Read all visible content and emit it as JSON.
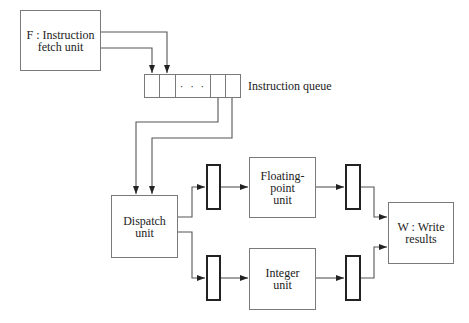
{
  "diagram": {
    "nodes": {
      "fetch": {
        "label": "F : Instruction\nfetch unit"
      },
      "queue": {
        "label": "Instruction queue",
        "ellipsis": "· · ·"
      },
      "dispatch": {
        "label": "Dispatch\nunit"
      },
      "fp": {
        "label": "Floating-\npoint\nunit"
      },
      "integer": {
        "label": "Integer\nunit"
      },
      "write": {
        "label": "W : Write\nresults"
      }
    },
    "edges": [
      {
        "from": "fetch",
        "to": "queue"
      },
      {
        "from": "fetch",
        "to": "queue"
      },
      {
        "from": "queue",
        "to": "dispatch"
      },
      {
        "from": "queue",
        "to": "dispatch"
      },
      {
        "from": "dispatch",
        "to": "fp",
        "via": "register"
      },
      {
        "from": "dispatch",
        "to": "integer",
        "via": "register"
      },
      {
        "from": "fp",
        "to": "write",
        "via": "register"
      },
      {
        "from": "integer",
        "to": "write",
        "via": "register"
      }
    ]
  }
}
